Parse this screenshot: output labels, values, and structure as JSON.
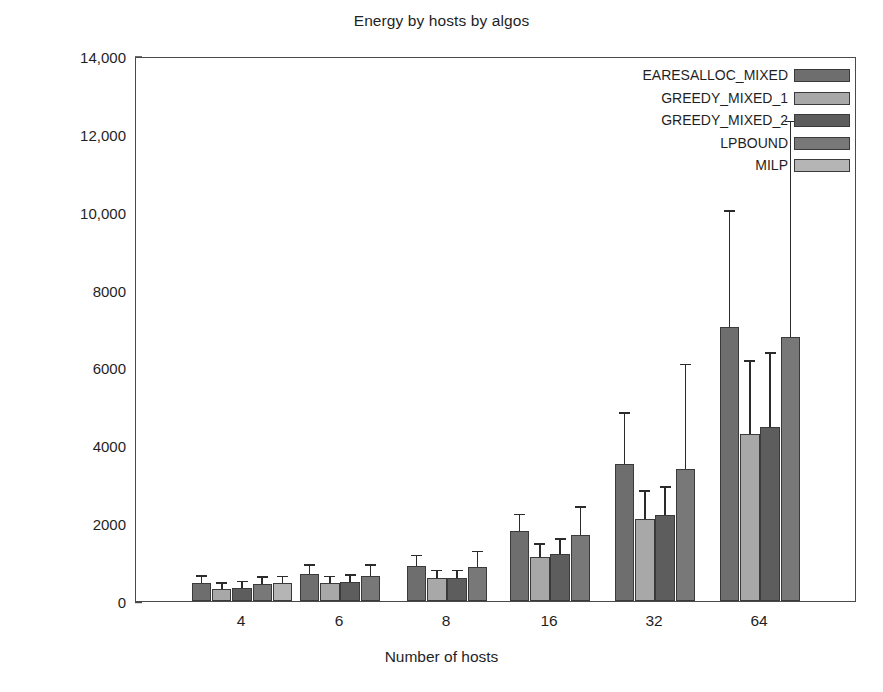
{
  "chart_data": {
    "type": "bar",
    "title": "Energy by hosts by algos",
    "xlabel": "Number of hosts",
    "ylabel": "Energy",
    "categories": [
      "4",
      "6",
      "8",
      "16",
      "32",
      "64"
    ],
    "ylim": [
      0,
      14000
    ],
    "yticks": [
      0,
      2000,
      4000,
      6000,
      8000,
      10000,
      12000,
      14000
    ],
    "ytick_labels": [
      "0",
      "2000",
      "4000",
      "6000",
      "8000",
      "10,000",
      "12,000",
      "14,000"
    ],
    "grid": false,
    "legend_position": "top-right",
    "error_bars": "upper-only",
    "series": [
      {
        "name": "EARESALLOC_MIXED",
        "color": "#6e6e6e",
        "values": [
          470,
          690,
          900,
          1800,
          3520,
          7050
        ],
        "err_upper": [
          620,
          900,
          1150,
          2200,
          4800,
          10000
        ]
      },
      {
        "name": "GREEDY_MIXED_1",
        "color": "#a8a8a8",
        "values": [
          310,
          460,
          600,
          1130,
          2100,
          4280
        ],
        "err_upper": [
          440,
          610,
          760,
          1450,
          2800,
          6150
        ]
      },
      {
        "name": "GREEDY_MIXED_2",
        "color": "#5d5d5d",
        "values": [
          330,
          490,
          580,
          1200,
          2200,
          4480
        ],
        "err_upper": [
          480,
          640,
          760,
          1580,
          2900,
          6350
        ]
      },
      {
        "name": "LPBOUND",
        "color": "#787878",
        "values": [
          440,
          640,
          870,
          1700,
          3380,
          6780
        ],
        "err_upper": [
          600,
          900,
          1250,
          2400,
          6050,
          12300
        ]
      },
      {
        "name": "MILP",
        "color": "#b5b5b5",
        "values": [
          450,
          null,
          null,
          null,
          null,
          null
        ],
        "err_upper": [
          610,
          null,
          null,
          null,
          null,
          null
        ]
      }
    ]
  },
  "legend": {
    "items": [
      {
        "label": "EARESALLOC_MIXED",
        "color": "#6e6e6e"
      },
      {
        "label": "GREEDY_MIXED_1",
        "color": "#a8a8a8"
      },
      {
        "label": "GREEDY_MIXED_2",
        "color": "#5d5d5d"
      },
      {
        "label": "LPBOUND",
        "color": "#787878"
      },
      {
        "label": "MILP",
        "color": "#b5b5b5"
      }
    ]
  },
  "axes": {
    "frame_color": "#4a4a4a",
    "text_color": "#1f1f1f"
  }
}
